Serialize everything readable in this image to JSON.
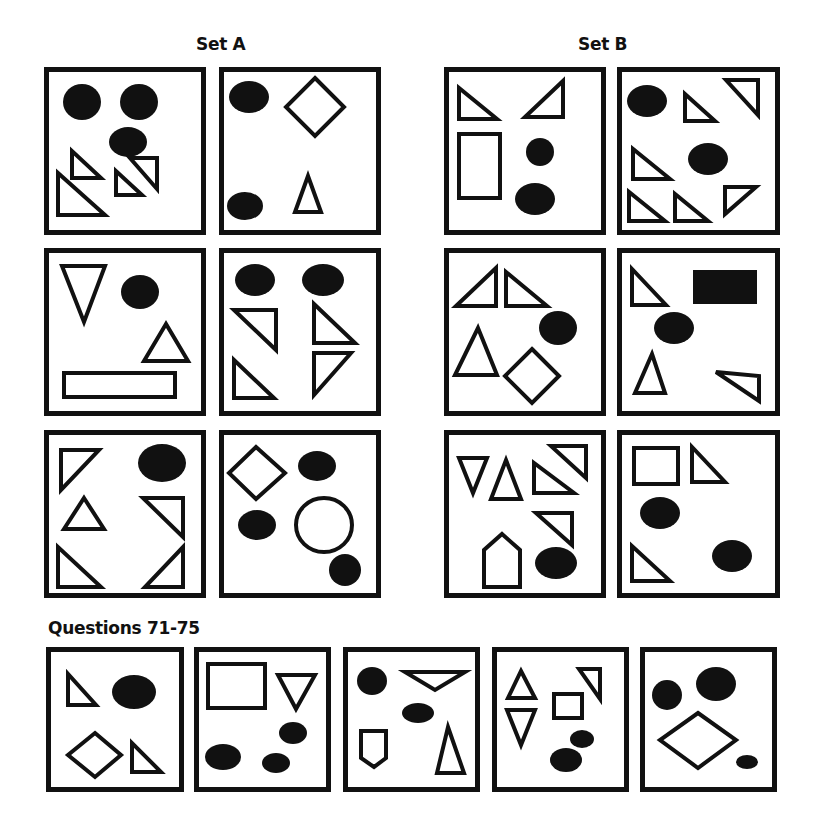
{
  "titles": {
    "set_a": "Set A",
    "set_b": "Set B",
    "questions": "Questions 71-75"
  },
  "colors": {
    "ink": "#111111",
    "paper": "#ffffff"
  },
  "stroke_width": 4,
  "panels": [
    {
      "id": "set-a-1",
      "group": "Set A",
      "x": 44,
      "y": 67,
      "w": 162,
      "h": 168,
      "shapes": [
        {
          "t": "ellipse",
          "cx": 38,
          "cy": 35,
          "rx": 19,
          "ry": 18,
          "fill": true
        },
        {
          "t": "ellipse",
          "cx": 95,
          "cy": 35,
          "rx": 19,
          "ry": 18,
          "fill": true
        },
        {
          "t": "ellipse",
          "cx": 84,
          "cy": 75,
          "rx": 19,
          "ry": 15,
          "fill": true
        },
        {
          "t": "poly",
          "pts": "28,84 28,111 57,111"
        },
        {
          "t": "poly",
          "pts": "113,91 113,122 86,91"
        },
        {
          "t": "poly",
          "pts": "72,104 72,128 98,128"
        },
        {
          "t": "poly",
          "pts": "14,106 14,148 61,148"
        }
      ]
    },
    {
      "id": "set-a-2",
      "group": "Set A",
      "x": 219,
      "y": 67,
      "w": 162,
      "h": 168,
      "shapes": [
        {
          "t": "ellipse",
          "cx": 30,
          "cy": 30,
          "rx": 20,
          "ry": 16,
          "fill": true
        },
        {
          "t": "poly",
          "pts": "96,11 125,40 96,69 67,40"
        },
        {
          "t": "ellipse",
          "cx": 26,
          "cy": 139,
          "rx": 18,
          "ry": 14,
          "fill": true
        },
        {
          "t": "poly",
          "pts": "89,109 102,145 76,145"
        }
      ]
    },
    {
      "id": "set-b-1",
      "group": "Set B",
      "x": 444,
      "y": 67,
      "w": 162,
      "h": 168,
      "shapes": [
        {
          "t": "poly",
          "pts": "15,21 15,52 53,52"
        },
        {
          "t": "poly",
          "pts": "119,14 119,50 81,50"
        },
        {
          "t": "rect",
          "x": 15,
          "y": 67,
          "w": 41,
          "h": 64
        },
        {
          "t": "ellipse",
          "cx": 96,
          "cy": 85,
          "rx": 14,
          "ry": 14,
          "fill": true
        },
        {
          "t": "ellipse",
          "cx": 91,
          "cy": 132,
          "rx": 20,
          "ry": 16,
          "fill": true
        }
      ]
    },
    {
      "id": "set-b-2",
      "group": "Set B",
      "x": 617,
      "y": 67,
      "w": 163,
      "h": 168,
      "shapes": [
        {
          "t": "ellipse",
          "cx": 30,
          "cy": 34,
          "rx": 20,
          "ry": 16,
          "fill": true
        },
        {
          "t": "poly",
          "pts": "68,27 68,54 98,54"
        },
        {
          "t": "poly",
          "pts": "109,13 141,13 141,48"
        },
        {
          "t": "ellipse",
          "cx": 91,
          "cy": 92,
          "rx": 20,
          "ry": 16,
          "fill": true
        },
        {
          "t": "poly",
          "pts": "16,82 16,112 53,112"
        },
        {
          "t": "poly",
          "pts": "12,125 12,154 48,154"
        },
        {
          "t": "poly",
          "pts": "58,127 58,154 91,154"
        },
        {
          "t": "poly",
          "pts": "108,120 108,147 139,120"
        }
      ]
    },
    {
      "id": "set-a-3",
      "group": "Set A",
      "x": 44,
      "y": 248,
      "w": 162,
      "h": 168,
      "shapes": [
        {
          "t": "poly",
          "pts": "18,18 61,18 40,74"
        },
        {
          "t": "ellipse",
          "cx": 96,
          "cy": 44,
          "rx": 19,
          "ry": 17,
          "fill": true
        },
        {
          "t": "poly",
          "pts": "122,76 100,113 144,113"
        },
        {
          "t": "rect",
          "x": 20,
          "y": 125,
          "w": 111,
          "h": 24
        }
      ]
    },
    {
      "id": "set-a-4",
      "group": "Set A",
      "x": 219,
      "y": 248,
      "w": 162,
      "h": 168,
      "shapes": [
        {
          "t": "ellipse",
          "cx": 36,
          "cy": 32,
          "rx": 20,
          "ry": 16,
          "fill": true
        },
        {
          "t": "ellipse",
          "cx": 104,
          "cy": 32,
          "rx": 21,
          "ry": 16,
          "fill": true
        },
        {
          "t": "poly",
          "pts": "15,62 57,62 57,102"
        },
        {
          "t": "poly",
          "pts": "95,56 95,95 136,95"
        },
        {
          "t": "poly",
          "pts": "15,112 15,150 55,150"
        },
        {
          "t": "poly",
          "pts": "95,105 95,147 132,105"
        }
      ]
    },
    {
      "id": "set-b-3",
      "group": "Set B",
      "x": 444,
      "y": 248,
      "w": 162,
      "h": 168,
      "shapes": [
        {
          "t": "poly",
          "pts": "52,20 52,58 12,58"
        },
        {
          "t": "poly",
          "pts": "62,24 62,58 103,58"
        },
        {
          "t": "ellipse",
          "cx": 114,
          "cy": 80,
          "rx": 19,
          "ry": 17,
          "fill": true
        },
        {
          "t": "poly",
          "pts": "34,80 53,127 11,127"
        },
        {
          "t": "poly",
          "pts": "88,101 115,128 88,155 61,128"
        }
      ]
    },
    {
      "id": "set-b-4",
      "group": "Set B",
      "x": 617,
      "y": 248,
      "w": 163,
      "h": 168,
      "shapes": [
        {
          "t": "poly",
          "pts": "15,21 15,57 49,57"
        },
        {
          "t": "rect",
          "x": 76,
          "y": 22,
          "w": 64,
          "h": 34,
          "fill": true
        },
        {
          "t": "ellipse",
          "cx": 57,
          "cy": 80,
          "rx": 20,
          "ry": 16,
          "fill": true
        },
        {
          "t": "poly",
          "pts": "35,106 48,145 18,145"
        },
        {
          "t": "poly",
          "pts": "99,124 142,128 142,153"
        }
      ]
    },
    {
      "id": "set-a-5",
      "group": "Set A",
      "x": 44,
      "y": 430,
      "w": 162,
      "h": 168,
      "shapes": [
        {
          "t": "poly",
          "pts": "17,20 55,20 17,60"
        },
        {
          "t": "ellipse",
          "cx": 118,
          "cy": 33,
          "rx": 24,
          "ry": 19,
          "fill": true
        },
        {
          "t": "poly",
          "pts": "40,68 60,99 20,99"
        },
        {
          "t": "poly",
          "pts": "99,68 139,68 139,107"
        },
        {
          "t": "poly",
          "pts": "14,117 14,157 57,157"
        },
        {
          "t": "poly",
          "pts": "139,117 139,157 101,157"
        }
      ]
    },
    {
      "id": "set-a-6",
      "group": "Set A",
      "x": 219,
      "y": 430,
      "w": 162,
      "h": 168,
      "shapes": [
        {
          "t": "poly",
          "pts": "37,17 66,43 37,69 10,43"
        },
        {
          "t": "ellipse",
          "cx": 98,
          "cy": 36,
          "rx": 19,
          "ry": 15,
          "fill": true
        },
        {
          "t": "ellipse",
          "cx": 38,
          "cy": 95,
          "rx": 19,
          "ry": 15,
          "fill": true
        },
        {
          "t": "ellipse",
          "cx": 105,
          "cy": 95,
          "rx": 28,
          "ry": 27,
          "fill": false
        },
        {
          "t": "ellipse",
          "cx": 126,
          "cy": 140,
          "rx": 16,
          "ry": 16,
          "fill": true
        }
      ]
    },
    {
      "id": "set-b-5",
      "group": "Set B",
      "x": 444,
      "y": 430,
      "w": 162,
      "h": 168,
      "shapes": [
        {
          "t": "poly",
          "pts": "15,28 43,28 29,63"
        },
        {
          "t": "poly",
          "pts": "62,30 77,69 47,69"
        },
        {
          "t": "poly",
          "pts": "107,16 142,16 142,48"
        },
        {
          "t": "poly",
          "pts": "90,33 90,63 130,63"
        },
        {
          "t": "poly",
          "pts": "92,83 128,83 128,115"
        },
        {
          "t": "poly",
          "pts": "58,104 76,120 76,157 40,157 40,120"
        },
        {
          "t": "ellipse",
          "cx": 112,
          "cy": 133,
          "rx": 21,
          "ry": 16,
          "fill": true
        }
      ]
    },
    {
      "id": "set-b-6",
      "group": "Set B",
      "x": 617,
      "y": 430,
      "w": 163,
      "h": 168,
      "shapes": [
        {
          "t": "rect",
          "x": 17,
          "y": 18,
          "w": 44,
          "h": 36
        },
        {
          "t": "poly",
          "pts": "75,17 75,52 108,52"
        },
        {
          "t": "ellipse",
          "cx": 43,
          "cy": 83,
          "rx": 20,
          "ry": 16,
          "fill": true
        },
        {
          "t": "poly",
          "pts": "15,116 15,151 53,151"
        },
        {
          "t": "ellipse",
          "cx": 115,
          "cy": 126,
          "rx": 20,
          "ry": 16,
          "fill": true
        }
      ]
    },
    {
      "id": "question-71",
      "group": "Questions 71-75",
      "x": 46,
      "y": 647,
      "w": 138,
      "h": 145,
      "shapes": [
        {
          "t": "poly",
          "pts": "22,27 22,58 50,58"
        },
        {
          "t": "ellipse",
          "cx": 88,
          "cy": 45,
          "rx": 22,
          "ry": 17,
          "fill": true
        },
        {
          "t": "poly",
          "pts": "49,86 75,108 49,130 22,108"
        },
        {
          "t": "poly",
          "pts": "86,96 86,125 115,125"
        }
      ]
    },
    {
      "id": "question-72",
      "group": "Questions 71-75",
      "x": 194,
      "y": 647,
      "w": 137,
      "h": 145,
      "shapes": [
        {
          "t": "rect",
          "x": 14,
          "y": 17,
          "w": 57,
          "h": 44
        },
        {
          "t": "poly",
          "pts": "84,28 121,28 102,62"
        },
        {
          "t": "ellipse",
          "cx": 99,
          "cy": 86,
          "rx": 14,
          "ry": 11,
          "fill": true
        },
        {
          "t": "ellipse",
          "cx": 29,
          "cy": 110,
          "rx": 18,
          "ry": 13,
          "fill": true
        },
        {
          "t": "ellipse",
          "cx": 82,
          "cy": 116,
          "rx": 14,
          "ry": 10,
          "fill": true
        }
      ]
    },
    {
      "id": "question-73",
      "group": "Questions 71-75",
      "x": 343,
      "y": 647,
      "w": 137,
      "h": 145,
      "shapes": [
        {
          "t": "ellipse",
          "cx": 29,
          "cy": 34,
          "rx": 15,
          "ry": 14,
          "fill": true
        },
        {
          "t": "poly",
          "pts": "62,25 122,25 92,43"
        },
        {
          "t": "ellipse",
          "cx": 75,
          "cy": 66,
          "rx": 16,
          "ry": 10,
          "fill": true
        },
        {
          "t": "poly",
          "pts": "18,84 43,84 43,111 31,120 18,111"
        },
        {
          "t": "poly",
          "pts": "105,80 121,126 94,126"
        }
      ]
    },
    {
      "id": "question-74",
      "group": "Questions 71-75",
      "x": 492,
      "y": 647,
      "w": 137,
      "h": 145,
      "shapes": [
        {
          "t": "poly",
          "pts": "29,24 43,51 16,51"
        },
        {
          "t": "poly",
          "pts": "15,63 43,63 29,98"
        },
        {
          "t": "rect",
          "x": 62,
          "y": 47,
          "w": 28,
          "h": 24
        },
        {
          "t": "poly",
          "pts": "87,22 108,22 108,52"
        },
        {
          "t": "ellipse",
          "cx": 90,
          "cy": 92,
          "rx": 12,
          "ry": 9,
          "fill": true
        },
        {
          "t": "ellipse",
          "cx": 74,
          "cy": 113,
          "rx": 16,
          "ry": 12,
          "fill": true
        }
      ]
    },
    {
      "id": "question-75",
      "group": "Questions 71-75",
      "x": 640,
      "y": 647,
      "w": 137,
      "h": 145,
      "shapes": [
        {
          "t": "ellipse",
          "cx": 27,
          "cy": 48,
          "rx": 15,
          "ry": 15,
          "fill": true
        },
        {
          "t": "ellipse",
          "cx": 76,
          "cy": 37,
          "rx": 20,
          "ry": 17,
          "fill": true
        },
        {
          "t": "poly",
          "pts": "58,66 96,93 58,121 20,93"
        },
        {
          "t": "ellipse",
          "cx": 107,
          "cy": 115,
          "rx": 11,
          "ry": 7,
          "fill": true
        }
      ]
    }
  ]
}
